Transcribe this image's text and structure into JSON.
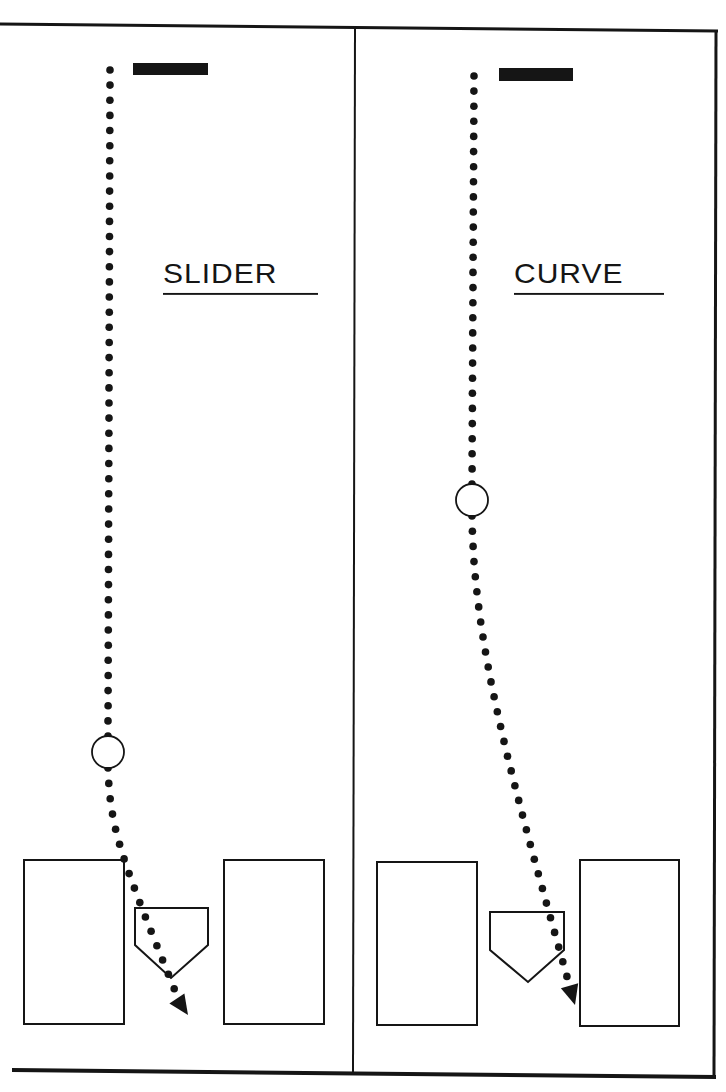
{
  "diagram": {
    "title": "",
    "colors": {
      "ink": "#151515",
      "paper": "#ffffff"
    },
    "panels": [
      {
        "id": "slider",
        "label": "SLIDER",
        "pitcher_rubber": {
          "x": 133,
          "y": 63,
          "w": 75,
          "h": 12
        },
        "trajectory": {
          "start": [
            110,
            70
          ],
          "break_point": {
            "cx": 108,
            "cy": 752,
            "r": 16
          },
          "end_arrow": [
            188,
            1015
          ]
        },
        "batters_boxes": [
          {
            "x": 24,
            "y": 860,
            "w": 100,
            "h": 164
          },
          {
            "x": 224,
            "y": 860,
            "w": 100,
            "h": 164
          }
        ],
        "home_plate": {
          "left": 135,
          "right": 208,
          "top": 908,
          "shoulder": 945,
          "point": [
            171,
            978
          ]
        }
      },
      {
        "id": "curve",
        "label": "CURVE",
        "pitcher_rubber": {
          "x": 499,
          "y": 68,
          "w": 74,
          "h": 13
        },
        "trajectory": {
          "start": [
            474,
            76
          ],
          "break_point": {
            "cx": 472,
            "cy": 500,
            "r": 16
          },
          "end_arrow": [
            575,
            1005
          ]
        },
        "batters_boxes": [
          {
            "x": 377,
            "y": 862,
            "w": 100,
            "h": 163
          },
          {
            "x": 580,
            "y": 860,
            "w": 99,
            "h": 166
          }
        ],
        "home_plate": {
          "left": 490,
          "right": 564,
          "top": 912,
          "shoulder": 950,
          "point": [
            528,
            982
          ]
        }
      }
    ]
  }
}
